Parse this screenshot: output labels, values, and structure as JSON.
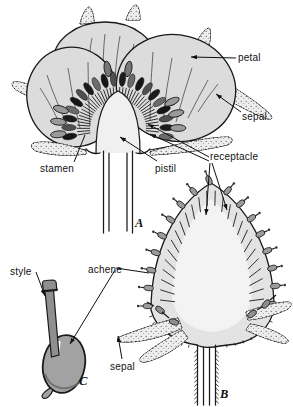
{
  "figure": {
    "labels": {
      "petal": "petal",
      "sepal_top": "sepal",
      "stamen": "stamen",
      "pistil": "pistil",
      "receptacle": "receptacle",
      "achene": "achene",
      "style": "style",
      "sepal_bottom": "sepal"
    },
    "caption_letters": {
      "a": "A",
      "b": "B",
      "c": "C"
    },
    "colors": {
      "ink": "#1a1a1a",
      "petal_fill": "#dcdcdc",
      "sepal_fill": "#ededed",
      "achene_fill": "#a0a0a0",
      "receptacle_outer": "#e3e3e3",
      "receptacle_inner": "#f3f3f3",
      "background": "#ffffff"
    }
  }
}
